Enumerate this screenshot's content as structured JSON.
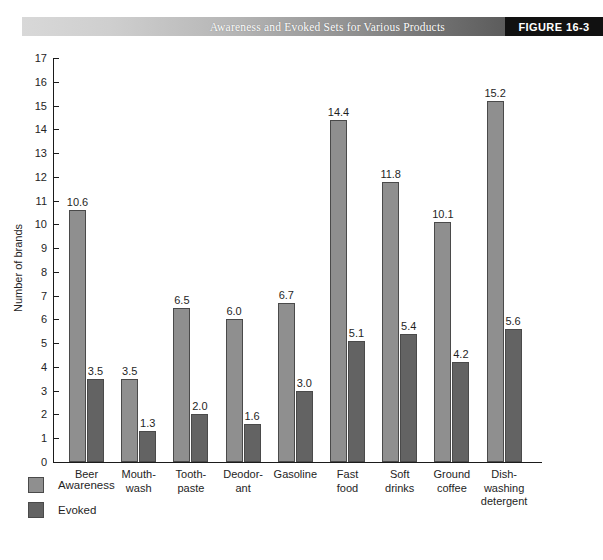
{
  "banner": {
    "title": "Awareness and Evoked Sets for Various Products",
    "figure_label": "FIGURE  16-3",
    "gradient_start": "#d8d8d8",
    "gradient_end": "#5c5c5c",
    "figure_block_color": "#111111"
  },
  "legend": {
    "position": "bottom-left",
    "items": [
      {
        "label": "Awareness",
        "color": "#8f8f8f",
        "swatch": "awareness-swatch"
      },
      {
        "label": "Evoked",
        "color": "#636363",
        "swatch": "evoked-swatch"
      }
    ]
  },
  "chart_data": {
    "type": "bar",
    "title": "Awareness and Evoked Sets for Various Products",
    "xlabel": "",
    "ylabel": "Number of brands",
    "ylim": [
      0,
      17
    ],
    "ytick_labels": [
      "17",
      "16",
      "15",
      "14",
      "13",
      "12",
      "11",
      "10",
      "9",
      "8",
      "7",
      "6",
      "5",
      "4",
      "3",
      "2",
      "1",
      "0"
    ],
    "yticks": [
      17,
      16,
      15,
      14,
      13,
      12,
      11,
      10,
      9,
      8,
      7,
      6,
      5,
      4,
      3,
      2,
      1,
      0
    ],
    "grid": false,
    "categories": [
      "Beer",
      "Mouth-\nwash",
      "Tooth-\npaste",
      "Deodor-\nant",
      "Gasoline",
      "Fast\nfood",
      "Soft\ndrinks",
      "Ground\ncoffee",
      "Dish-\nwashing\ndetergent"
    ],
    "category_lines": [
      [
        "Beer"
      ],
      [
        "Mouth-",
        "wash"
      ],
      [
        "Tooth-",
        "paste"
      ],
      [
        "Deodor-",
        "ant"
      ],
      [
        "Gasoline"
      ],
      [
        "Fast",
        "food"
      ],
      [
        "Soft",
        "drinks"
      ],
      [
        "Ground",
        "coffee"
      ],
      [
        "Dish-",
        "washing",
        "detergent"
      ]
    ],
    "series": [
      {
        "name": "Awareness",
        "color": "#8f8f8f",
        "values": [
          10.6,
          3.5,
          6.5,
          6.0,
          6.7,
          14.4,
          11.8,
          10.1,
          15.2
        ],
        "labels": [
          "10.6",
          "3.5",
          "6.5",
          "6.0",
          "6.7",
          "14.4",
          "11.8",
          "10.1",
          "15.2"
        ]
      },
      {
        "name": "Evoked",
        "color": "#636363",
        "values": [
          3.5,
          1.3,
          2.0,
          1.6,
          3.0,
          5.1,
          5.4,
          4.2,
          5.6
        ],
        "labels": [
          "3.5",
          "1.3",
          "2.0",
          "1.6",
          "3.0",
          "5.1",
          "5.4",
          "4.2",
          "5.6"
        ]
      }
    ]
  }
}
